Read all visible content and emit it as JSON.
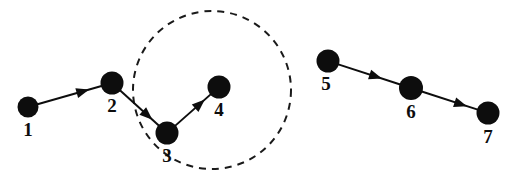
{
  "figure": {
    "type": "node-link-diagram",
    "width": 519,
    "height": 178,
    "background_color": "#ffffff",
    "node_color": "#0d0d0d",
    "edge_color": "#0d0d0d",
    "region_color": "#1a1a1a",
    "label_color": "#0d0d0d"
  },
  "nodes": [
    {
      "id": "1",
      "label": "1",
      "cx": 28,
      "cy": 107,
      "r": 10.5,
      "label_x": 28,
      "label_y": 120
    },
    {
      "id": "2",
      "label": "2",
      "cx": 112,
      "cy": 83,
      "r": 11.5,
      "label_x": 112,
      "label_y": 96
    },
    {
      "id": "3",
      "label": "3",
      "cx": 167,
      "cy": 133,
      "r": 11.5,
      "label_x": 167,
      "label_y": 146
    },
    {
      "id": "4",
      "label": "4",
      "cx": 219,
      "cy": 87,
      "r": 11.5,
      "label_x": 219,
      "label_y": 100
    },
    {
      "id": "5",
      "label": "5",
      "cx": 328,
      "cy": 61,
      "r": 11.5,
      "label_x": 326,
      "label_y": 74
    },
    {
      "id": "6",
      "label": "6",
      "cx": 411,
      "cy": 88,
      "r": 12.0,
      "label_x": 411,
      "label_y": 102
    },
    {
      "id": "7",
      "label": "7",
      "cx": 488,
      "cy": 113,
      "r": 11.5,
      "label_x": 488,
      "label_y": 127
    }
  ],
  "edges": [
    {
      "from": "1",
      "to": "2",
      "directed": true,
      "arrow_t": 0.8
    },
    {
      "from": "2",
      "to": "3",
      "directed": true,
      "arrow_t": 0.82
    },
    {
      "from": "3",
      "to": "4",
      "directed": true,
      "arrow_t": 0.82
    },
    {
      "from": "5",
      "to": "6",
      "directed": true,
      "arrow_t": 0.7
    },
    {
      "from": "6",
      "to": "7",
      "directed": true,
      "arrow_t": 0.8
    }
  ],
  "regions": [
    {
      "id": "dashed-circle",
      "shape": "circle",
      "cx": 212,
      "cy": 90,
      "r": 79,
      "stroke_style": "dashed",
      "dash": "7 6",
      "stroke_width": 2,
      "encloses": [
        "3",
        "4"
      ]
    }
  ]
}
